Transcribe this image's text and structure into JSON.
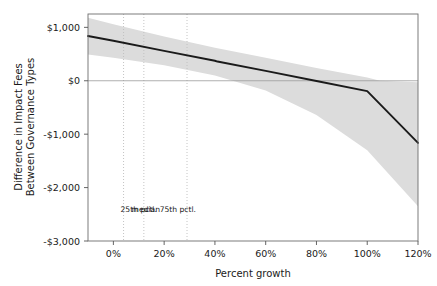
{
  "chart_data": {
    "type": "line",
    "title": "",
    "subtitle": "",
    "xlabel": "Percent growth",
    "ylabel": "Difference in Impact Fees Between Governance Types",
    "ylabel_line1": "Difference in Impact Fees",
    "ylabel_line2": "Between Governance Types",
    "xlim": [
      -10,
      120
    ],
    "ylim": [
      -3000,
      1250
    ],
    "xticks": [
      0,
      20,
      40,
      60,
      80,
      100,
      120
    ],
    "xticklabels": [
      "0%",
      "20%",
      "40%",
      "60%",
      "80%",
      "100%",
      "120%"
    ],
    "yticks": [
      1000,
      0,
      -1000,
      -2000,
      -3000
    ],
    "yticklabels": [
      "$1,000",
      "$0",
      "-$1,000",
      "-$2,000",
      "-$3,000"
    ],
    "grid": false,
    "legend": "none",
    "zero_reference_line": 0,
    "series": [
      {
        "name": "Predicted difference",
        "type": "line",
        "color": "#1a1a1a",
        "x": [
          -10,
          0,
          20,
          40,
          41,
          60,
          80,
          100,
          120
        ],
        "values": [
          837,
          750,
          560,
          375,
          360,
          185,
          -5,
          -195,
          -1163
        ]
      },
      {
        "name": "95% confidence band (upper)",
        "type": "band-upper",
        "color": "#d9d9d9",
        "x": [
          -10,
          0,
          20,
          40,
          60,
          80,
          100,
          105,
          120
        ],
        "values": [
          1180,
          1060,
          830,
          620,
          430,
          240,
          60,
          0,
          -30
        ]
      },
      {
        "name": "95% confidence band (lower)",
        "type": "band-lower",
        "color": "#d9d9d9",
        "x": [
          -10,
          0,
          20,
          40,
          60,
          80,
          100,
          120
        ],
        "values": [
          490,
          430,
          290,
          100,
          -180,
          -640,
          -1300,
          -2350
        ]
      }
    ],
    "reference_lines": [
      {
        "label": "25th pctl.",
        "x": 4,
        "style": "dotted",
        "color": "#bdbdbd"
      },
      {
        "label": "median",
        "x": 12,
        "style": "dotted",
        "color": "#bdbdbd"
      },
      {
        "label": "75th pctl.",
        "x": 29,
        "style": "dotted",
        "color": "#bdbdbd"
      }
    ],
    "annotations": [
      {
        "text": "25th pctl.",
        "x": 4,
        "y": -2450
      },
      {
        "text": "median",
        "x": 12,
        "y": -2450
      },
      {
        "text": "75th pctl.",
        "x": 29,
        "y": -2450
      }
    ],
    "colors": {
      "line": "#1a1a1a",
      "band": "#d9d9d9",
      "axis": "#555555",
      "reference": "#c4c4c4",
      "background": "#ffffff"
    }
  }
}
